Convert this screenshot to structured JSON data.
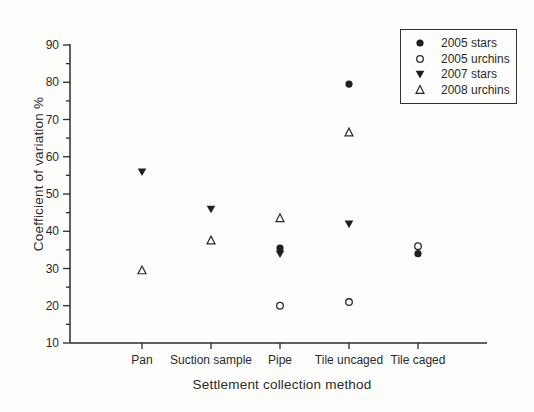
{
  "chart_data": {
    "type": "scatter",
    "title": "",
    "xlabel": "Settlement collection method",
    "ylabel": "Coefficient of variation %",
    "ylim": [
      10,
      90
    ],
    "y_major_step": 10,
    "y_minor_step": 5,
    "grid": false,
    "legend_position": "top-right-inside-box",
    "categories": [
      "Pan",
      "Suction sample",
      "Pipe",
      "Tile uncaged",
      "Tile caged"
    ],
    "y_tick_labels": [
      "10",
      "20",
      "30",
      "40",
      "50",
      "60",
      "70",
      "80",
      "90"
    ],
    "series": [
      {
        "name": "2005 stars",
        "marker": "filled-circle",
        "values": [
          null,
          null,
          35.5,
          79.5,
          34
        ]
      },
      {
        "name": "2005 urchins",
        "marker": "open-circle",
        "values": [
          null,
          null,
          20,
          21,
          36
        ]
      },
      {
        "name": "2007 stars",
        "marker": "filled-triangle-down",
        "values": [
          56,
          46,
          34,
          42,
          null
        ]
      },
      {
        "name": "2008 urchins",
        "marker": "open-triangle-up",
        "values": [
          29.5,
          37.5,
          43.5,
          66.5,
          null
        ]
      }
    ],
    "colors": {
      "ink": "#2b2b2b",
      "marker_fill": "#1f1f1f",
      "open_fill": "#fdfdfc"
    }
  }
}
